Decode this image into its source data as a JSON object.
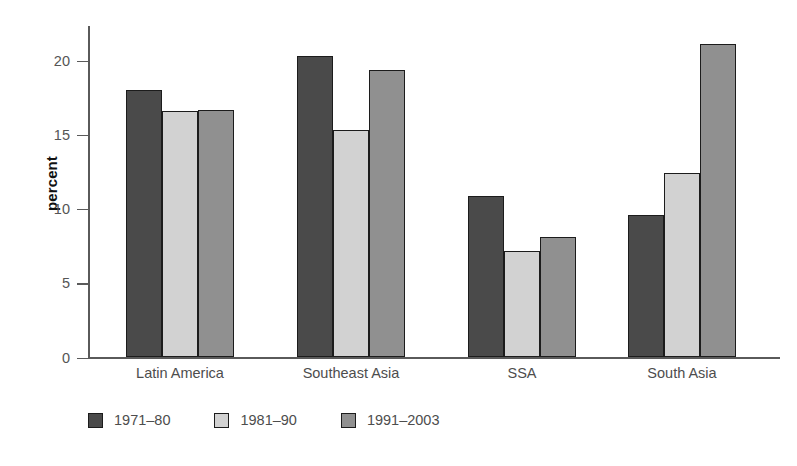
{
  "chart_data": {
    "type": "bar",
    "title": "",
    "subtitle": "",
    "xlabel": "",
    "ylabel": "percent",
    "categories": [
      "Latin America",
      "Southeast Asia",
      "SSA",
      "South Asia"
    ],
    "series": [
      {
        "name": "1971–80",
        "color": "#4a4a4a",
        "values": [
          18.0,
          20.3,
          10.9,
          9.6
        ]
      },
      {
        "name": "1981–90",
        "color": "#d2d2d2",
        "values": [
          16.6,
          15.3,
          7.2,
          12.4
        ]
      },
      {
        "name": "1991–2003",
        "color": "#909090",
        "values": [
          16.7,
          19.4,
          8.1,
          21.1
        ]
      }
    ],
    "ylim": [
      0,
      22
    ],
    "yticks": [
      0,
      5,
      10,
      15,
      20
    ],
    "ytick_labels": [
      "0",
      "5",
      "10",
      "15",
      "20"
    ],
    "grid": false,
    "legend_position": "bottom-left",
    "bar_edge_color": "#1c1c1c",
    "axis_color": "#5a5a5a",
    "text_color": "#4d4d4d",
    "background": "#ffffff"
  },
  "axis": {
    "y_title": "percent"
  }
}
